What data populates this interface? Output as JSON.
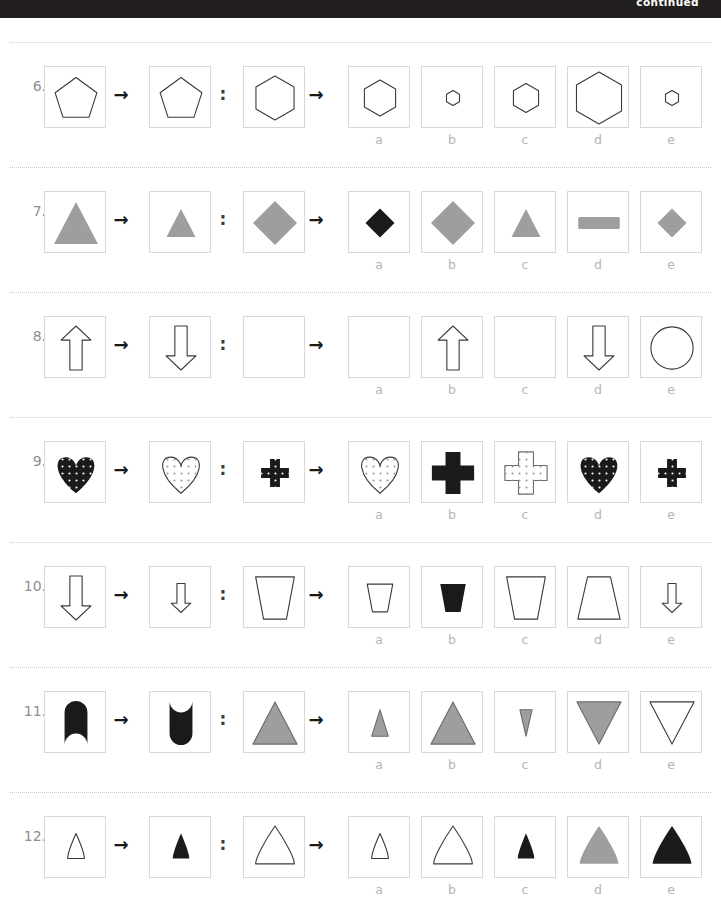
{
  "header": {
    "continued_label": "continued"
  },
  "option_letters": [
    "a",
    "b",
    "c",
    "d",
    "e"
  ],
  "colors": {
    "ink": "#231f20",
    "gray_fill": "#9e9e9e",
    "box_border": "#d8d8d8",
    "rule": "#c9c9c9",
    "label_gray": "#b5b5b5",
    "number_gray": "#8e8e8e",
    "topbar": "#231f20"
  },
  "glyphs": {
    "arrow": "→",
    "colon": ":"
  },
  "questions": [
    {
      "number": "6.",
      "stem": [
        {
          "shape": "pentagon",
          "fill": "none",
          "stroke": "#3a3a3a",
          "size": "large"
        },
        {
          "shape": "pentagon",
          "fill": "none",
          "stroke": "#3a3a3a",
          "size": "large"
        },
        {
          "shape": "hexagon",
          "fill": "none",
          "stroke": "#3a3a3a",
          "size": "large"
        }
      ],
      "options": [
        {
          "letter": "a",
          "shape": "hexagon",
          "fill": "none",
          "stroke": "#3a3a3a",
          "size": "medium"
        },
        {
          "letter": "b",
          "shape": "hexagon",
          "fill": "none",
          "stroke": "#3a3a3a",
          "size": "tiny"
        },
        {
          "letter": "c",
          "shape": "hexagon",
          "fill": "none",
          "stroke": "#3a3a3a",
          "size": "small"
        },
        {
          "letter": "d",
          "shape": "hexagon",
          "fill": "none",
          "stroke": "#3a3a3a",
          "size": "xlarge"
        },
        {
          "letter": "e",
          "shape": "hexagon",
          "fill": "none",
          "stroke": "#3a3a3a",
          "size": "tiny"
        }
      ]
    },
    {
      "number": "7.",
      "stem": [
        {
          "shape": "triangle",
          "fill": "#9e9e9e",
          "stroke": "none",
          "size": "large"
        },
        {
          "shape": "triangle",
          "fill": "#9e9e9e",
          "stroke": "none",
          "size": "small"
        },
        {
          "shape": "diamond",
          "fill": "#9e9e9e",
          "stroke": "none",
          "size": "large"
        }
      ],
      "options": [
        {
          "letter": "a",
          "shape": "diamond",
          "fill": "#1a1a1a",
          "stroke": "none",
          "size": "small"
        },
        {
          "letter": "b",
          "shape": "diamond",
          "fill": "#9e9e9e",
          "stroke": "none",
          "size": "large"
        },
        {
          "letter": "c",
          "shape": "triangle",
          "fill": "#9e9e9e",
          "stroke": "none",
          "size": "small"
        },
        {
          "letter": "d",
          "shape": "rectangle",
          "fill": "#9e9e9e",
          "stroke": "none",
          "size": "wide"
        },
        {
          "letter": "e",
          "shape": "diamond",
          "fill": "#9e9e9e",
          "stroke": "none",
          "size": "small"
        }
      ]
    },
    {
      "number": "8.",
      "stem": [
        {
          "shape": "arrow-up",
          "fill": "none",
          "stroke": "#3a3a3a",
          "size": "large"
        },
        {
          "shape": "arrow-down",
          "fill": "none",
          "stroke": "#3a3a3a",
          "size": "large"
        },
        {
          "shape": "smiley",
          "fill": "none",
          "stroke": "#3a3a3a",
          "size": "large"
        }
      ],
      "options": [
        {
          "letter": "a",
          "shape": "smiley-inverted",
          "fill": "none",
          "stroke": "#3a3a3a",
          "size": "large"
        },
        {
          "letter": "b",
          "shape": "arrow-up",
          "fill": "none",
          "stroke": "#3a3a3a",
          "size": "large"
        },
        {
          "letter": "c",
          "shape": "smiley",
          "fill": "none",
          "stroke": "#3a3a3a",
          "size": "large"
        },
        {
          "letter": "d",
          "shape": "arrow-down",
          "fill": "none",
          "stroke": "#3a3a3a",
          "size": "large"
        },
        {
          "letter": "e",
          "shape": "circle",
          "fill": "none",
          "stroke": "#3a3a3a",
          "size": "large"
        }
      ]
    },
    {
      "number": "9.",
      "stem": [
        {
          "shape": "heart",
          "fill": "#1a1a1a",
          "stroke": "none",
          "pattern": "white-dots",
          "size": "large"
        },
        {
          "shape": "heart",
          "fill": "none",
          "stroke": "#3a3a3a",
          "pattern": "gray-dots",
          "size": "large"
        },
        {
          "shape": "cross",
          "fill": "#1a1a1a",
          "stroke": "none",
          "pattern": "white-dots",
          "size": "small"
        }
      ],
      "options": [
        {
          "letter": "a",
          "shape": "heart",
          "fill": "none",
          "stroke": "#3a3a3a",
          "pattern": "gray-dots",
          "size": "large"
        },
        {
          "letter": "b",
          "shape": "cross",
          "fill": "#1a1a1a",
          "stroke": "none",
          "pattern": "none",
          "size": "large"
        },
        {
          "letter": "c",
          "shape": "cross",
          "fill": "none",
          "stroke": "#6a6a6a",
          "pattern": "gray-dots",
          "size": "large"
        },
        {
          "letter": "d",
          "shape": "heart",
          "fill": "#1a1a1a",
          "stroke": "none",
          "pattern": "white-dots",
          "size": "large"
        },
        {
          "letter": "e",
          "shape": "cross",
          "fill": "#1a1a1a",
          "stroke": "none",
          "pattern": "white-dots",
          "size": "small"
        }
      ]
    },
    {
      "number": "10.",
      "stem": [
        {
          "shape": "arrow-down",
          "fill": "none",
          "stroke": "#3a3a3a",
          "size": "large"
        },
        {
          "shape": "arrow-down",
          "fill": "none",
          "stroke": "#3a3a3a",
          "size": "small"
        },
        {
          "shape": "trapezoid-down",
          "fill": "none",
          "stroke": "#3a3a3a",
          "size": "large"
        }
      ],
      "options": [
        {
          "letter": "a",
          "shape": "trapezoid-down",
          "fill": "none",
          "stroke": "#3a3a3a",
          "size": "small"
        },
        {
          "letter": "b",
          "shape": "trapezoid-down",
          "fill": "#1a1a1a",
          "stroke": "none",
          "size": "small"
        },
        {
          "letter": "c",
          "shape": "trapezoid-down",
          "fill": "none",
          "stroke": "#3a3a3a",
          "size": "large"
        },
        {
          "letter": "d",
          "shape": "trapezoid-up",
          "fill": "none",
          "stroke": "#3a3a3a",
          "size": "large"
        },
        {
          "letter": "e",
          "shape": "arrow-down",
          "fill": "none",
          "stroke": "#3a3a3a",
          "size": "small"
        }
      ]
    },
    {
      "number": "11.",
      "stem": [
        {
          "shape": "notched-top",
          "fill": "#1a1a1a",
          "stroke": "none",
          "size": "large"
        },
        {
          "shape": "notched-bottom",
          "fill": "#1a1a1a",
          "stroke": "none",
          "size": "large"
        },
        {
          "shape": "triangle",
          "fill": "#9e9e9e",
          "stroke": "#6a6a6a",
          "size": "large"
        }
      ],
      "options": [
        {
          "letter": "a",
          "shape": "triangle",
          "fill": "#9e9e9e",
          "stroke": "#6a6a6a",
          "size": "narrow"
        },
        {
          "letter": "b",
          "shape": "triangle",
          "fill": "#9e9e9e",
          "stroke": "#6a6a6a",
          "size": "large"
        },
        {
          "letter": "c",
          "shape": "triangle-down",
          "fill": "#9e9e9e",
          "stroke": "#6a6a6a",
          "size": "narrow"
        },
        {
          "letter": "d",
          "shape": "triangle-down",
          "fill": "#9e9e9e",
          "stroke": "#6a6a6a",
          "size": "large"
        },
        {
          "letter": "e",
          "shape": "triangle-down",
          "fill": "none",
          "stroke": "#3a3a3a",
          "size": "large"
        }
      ]
    },
    {
      "number": "12.",
      "stem": [
        {
          "shape": "kite",
          "fill": "none",
          "stroke": "#3a3a3a",
          "size": "small"
        },
        {
          "shape": "kite",
          "fill": "#1a1a1a",
          "stroke": "none",
          "size": "small"
        },
        {
          "shape": "kite",
          "fill": "none",
          "stroke": "#3a3a3a",
          "size": "large"
        }
      ],
      "options": [
        {
          "letter": "a",
          "shape": "kite",
          "fill": "none",
          "stroke": "#3a3a3a",
          "size": "small"
        },
        {
          "letter": "b",
          "shape": "kite",
          "fill": "none",
          "stroke": "#3a3a3a",
          "size": "large"
        },
        {
          "letter": "c",
          "shape": "kite",
          "fill": "#1a1a1a",
          "stroke": "none",
          "size": "small"
        },
        {
          "letter": "d",
          "shape": "kite",
          "fill": "#9e9e9e",
          "stroke": "none",
          "size": "large"
        },
        {
          "letter": "e",
          "shape": "kite",
          "fill": "#1a1a1a",
          "stroke": "none",
          "size": "large"
        }
      ]
    }
  ]
}
